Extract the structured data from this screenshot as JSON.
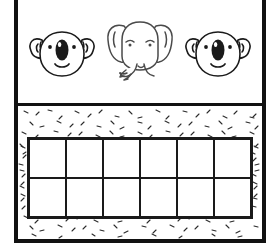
{
  "worksheet": {
    "title": "Animal counting ten-frame worksheet",
    "background_color": "#ffffff",
    "ink_color": "#111111"
  },
  "top_panel": {
    "name": "animal-row",
    "animal_count": 3,
    "animals": [
      {
        "species": "koala",
        "label": "koala-face",
        "position": "left"
      },
      {
        "species": "elephant",
        "label": "elephant-face",
        "position": "center"
      },
      {
        "species": "koala",
        "label": "koala-face",
        "position": "right"
      }
    ]
  },
  "bottom_panel": {
    "name": "ten-frame-panel",
    "background_texture": "speckled-dash-stipple",
    "grid": {
      "columns": 6,
      "rows": 2,
      "total_cells": 12,
      "cells_filled": 0,
      "cell_contents": [
        "",
        "",
        "",
        "",
        "",
        "",
        "",
        "",
        "",
        "",
        "",
        ""
      ]
    }
  }
}
